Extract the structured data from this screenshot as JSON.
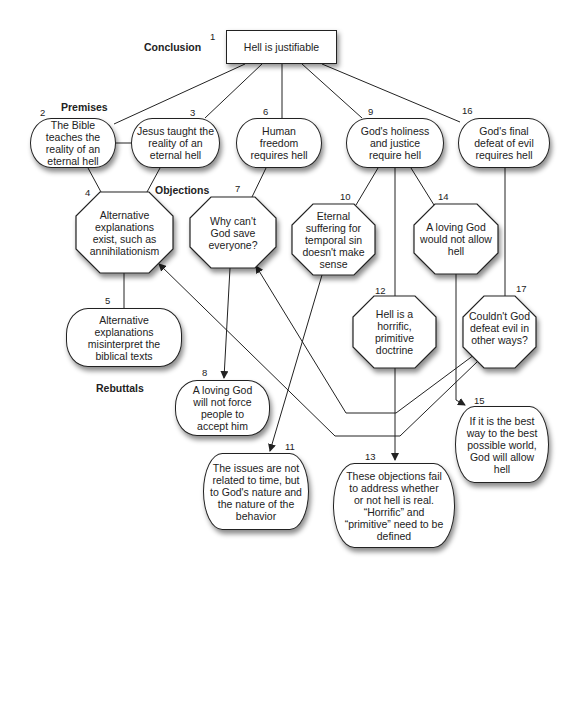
{
  "sections": {
    "conclusion": "Conclusion",
    "premises": "Premises",
    "objections": "Objections",
    "rebuttals": "Rebuttals"
  },
  "nodes": {
    "n1": {
      "number": "1",
      "text": "Hell is justifiable",
      "kind": "conclusion"
    },
    "n2": {
      "number": "2",
      "text": "The Bible teaches the reality of an eternal hell",
      "kind": "premise"
    },
    "n3": {
      "number": "3",
      "text": "Jesus taught the reality of an eternal hell",
      "kind": "premise"
    },
    "n4": {
      "number": "4",
      "text": "Alternative explanations exist, such as annihilationism",
      "kind": "objection"
    },
    "n5": {
      "number": "5",
      "text": "Alternative explanations misinterpret the biblical texts",
      "kind": "rebuttal"
    },
    "n6": {
      "number": "6",
      "text": "Human freedom requires hell",
      "kind": "premise"
    },
    "n7": {
      "number": "7",
      "text": "Why can't God save everyone?",
      "kind": "objection"
    },
    "n8": {
      "number": "8",
      "text": "A loving God will not force people to accept him",
      "kind": "rebuttal"
    },
    "n9": {
      "number": "9",
      "text": "God's holiness and justice require hell",
      "kind": "premise"
    },
    "n10": {
      "number": "10",
      "text": "Eternal suffering for temporal sin doesn't make sense",
      "kind": "objection"
    },
    "n11": {
      "number": "11",
      "text": "The issues are not related to time, but to God's nature and the nature of the behavior",
      "kind": "rebuttal"
    },
    "n12": {
      "number": "12",
      "text": "Hell is a horrific, primitive doctrine",
      "kind": "objection"
    },
    "n13": {
      "number": "13",
      "text": "These objections fail to address whether or not hell is real. “Horrific” and “primitive” need to be defined",
      "kind": "rebuttal"
    },
    "n14": {
      "number": "14",
      "text": "A loving God would not allow hell",
      "kind": "objection"
    },
    "n15": {
      "number": "15",
      "text": "If it is the best way to the best possible world, God will allow hell",
      "kind": "rebuttal"
    },
    "n16": {
      "number": "16",
      "text": "God's final defeat of evil requires hell",
      "kind": "premise"
    },
    "n17": {
      "number": "17",
      "text": "Couldn't God defeat evil in other ways?",
      "kind": "objection"
    }
  },
  "edges": [
    {
      "from": "1",
      "to": "2",
      "arrow": false
    },
    {
      "from": "1",
      "to": "3",
      "arrow": false
    },
    {
      "from": "1",
      "to": "6",
      "arrow": false
    },
    {
      "from": "1",
      "to": "9",
      "arrow": false
    },
    {
      "from": "1",
      "to": "16",
      "arrow": false
    },
    {
      "from": "2",
      "to": "3",
      "arrow": false
    },
    {
      "from": "2",
      "to": "4",
      "arrow": false
    },
    {
      "from": "3",
      "to": "4",
      "arrow": false
    },
    {
      "from": "4",
      "to": "5",
      "arrow": false
    },
    {
      "from": "6",
      "to": "7",
      "arrow": false
    },
    {
      "from": "7",
      "to": "8",
      "arrow": true
    },
    {
      "from": "9",
      "to": "10",
      "arrow": false
    },
    {
      "from": "9",
      "to": "12",
      "arrow": false
    },
    {
      "from": "9",
      "to": "14",
      "arrow": false
    },
    {
      "from": "10",
      "to": "11",
      "arrow": true
    },
    {
      "from": "12",
      "to": "13",
      "arrow": true
    },
    {
      "from": "14",
      "to": "15",
      "arrow": true
    },
    {
      "from": "16",
      "to": "17",
      "arrow": false
    },
    {
      "from": "17",
      "to": "7",
      "arrow": true
    },
    {
      "from": "17",
      "to": "4",
      "arrow": true
    }
  ]
}
